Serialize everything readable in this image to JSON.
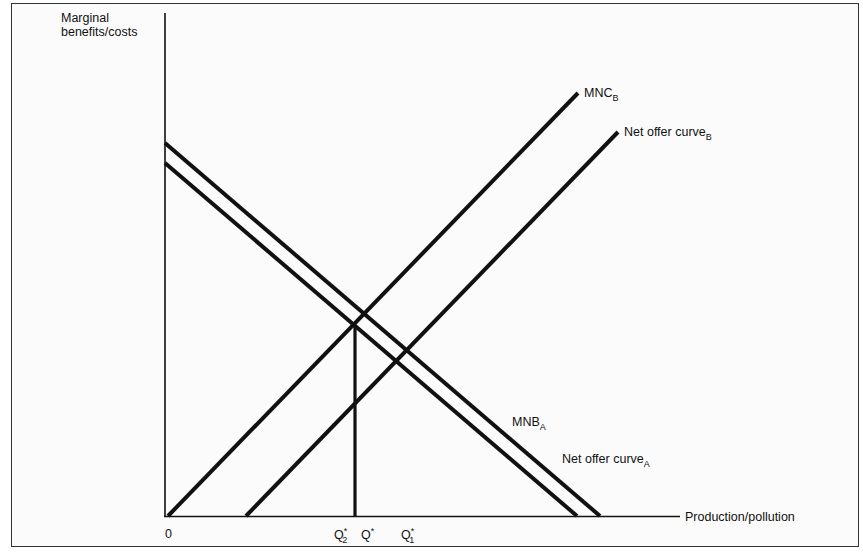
{
  "diagram": {
    "y_axis_label_line1": "Marginal",
    "y_axis_label_line2": "benefits/costs",
    "x_axis_label": "Production/pollution",
    "origin_label": "0",
    "curves": {
      "mnc_b": {
        "label": "MNC",
        "subscript": "B"
      },
      "net_offer_b": {
        "label": "Net offer curve",
        "subscript": "B"
      },
      "mnb_a": {
        "label": "MNB",
        "subscript": "A"
      },
      "net_offer_a": {
        "label": "Net offer curve",
        "subscript": "A"
      }
    },
    "quantities": [
      {
        "label": "Q",
        "superscript": "*",
        "subscript": "2"
      },
      {
        "label": "Q",
        "superscript": "*",
        "subscript": ""
      },
      {
        "label": "Q",
        "superscript": "*",
        "subscript": "1"
      }
    ],
    "colors": {
      "line": "#111111",
      "frame": "#333333",
      "background": "#fbfbfb"
    }
  }
}
